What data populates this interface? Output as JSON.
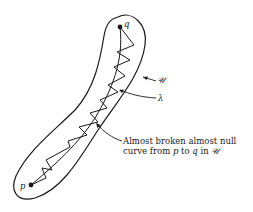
{
  "diagram": {
    "labels": {
      "q": "q",
      "p": "p",
      "region": "𝒰",
      "curve": "λ",
      "caption_line1": "Almost broken almost null",
      "caption_line2_pre": "curve from ",
      "caption_p": "p",
      "caption_to": " to ",
      "caption_q": "q",
      "caption_in": " in ",
      "caption_region": "𝒰"
    },
    "points": {
      "q": [
        120,
        27
      ],
      "p": [
        31,
        185
      ]
    },
    "colors": {
      "stroke": "#1a1a1a",
      "background": "#ffffff"
    }
  }
}
